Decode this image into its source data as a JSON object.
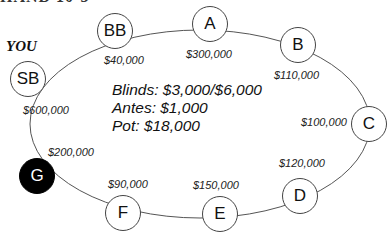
{
  "heading_fragment": "HAND 10-3",
  "you_label": "YOU",
  "info": {
    "blinds": "Blinds: $3,000/$6,000",
    "antes": "Antes: $1,000",
    "pot": "Pot: $18,000"
  },
  "seats": [
    {
      "label": "SB",
      "stack": "$600,000",
      "hero": false
    },
    {
      "label": "BB",
      "stack": "$40,000",
      "hero": false
    },
    {
      "label": "A",
      "stack": "$300,000",
      "hero": false
    },
    {
      "label": "B",
      "stack": "$110,000",
      "hero": false
    },
    {
      "label": "C",
      "stack": "$100,000",
      "hero": false
    },
    {
      "label": "D",
      "stack": "$120,000",
      "hero": false
    },
    {
      "label": "E",
      "stack": "$150,000",
      "hero": false
    },
    {
      "label": "F",
      "stack": "$90,000",
      "hero": false
    },
    {
      "label": "G",
      "stack": "$200,000",
      "hero": true
    }
  ],
  "colors": {
    "hero_fill": "#000000",
    "seat_fill": "#ffffff",
    "ring_stroke": "#555555"
  }
}
